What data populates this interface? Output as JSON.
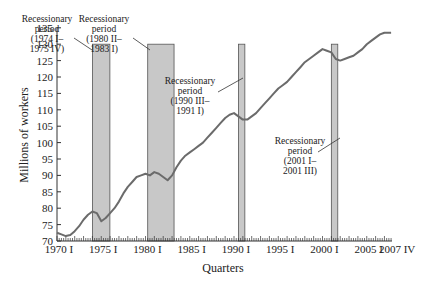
{
  "chart_data": {
    "type": "line",
    "title": "",
    "xlabel": "Quarters",
    "ylabel": "Millions of workers",
    "ylim": [
      70,
      135
    ],
    "yticks": [
      70,
      75,
      80,
      85,
      90,
      95,
      100,
      105,
      110,
      115,
      120,
      125,
      130,
      135
    ],
    "xticks": [
      {
        "label": "1970 I",
        "year": 1970.0
      },
      {
        "label": "1975 I",
        "year": 1975.0
      },
      {
        "label": "1980 I",
        "year": 1980.0
      },
      {
        "label": "1985 I",
        "year": 1985.0
      },
      {
        "label": "1990 I",
        "year": 1990.0
      },
      {
        "label": "1995 I",
        "year": 1995.0
      },
      {
        "label": "2000 I",
        "year": 2000.0
      },
      {
        "label": "2005 I",
        "year": 2005.0
      },
      {
        "label": "2007 IV",
        "year": 2007.75
      }
    ],
    "grid": false,
    "series": [
      {
        "name": "Employment",
        "x": [
          1970.0,
          1970.5,
          1971.0,
          1971.5,
          1972.0,
          1972.5,
          1973.0,
          1973.5,
          1974.0,
          1974.5,
          1975.0,
          1975.5,
          1976.0,
          1976.5,
          1977.0,
          1977.5,
          1978.0,
          1978.5,
          1979.0,
          1979.5,
          1980.0,
          1980.5,
          1981.0,
          1981.5,
          1982.0,
          1982.5,
          1983.0,
          1983.5,
          1984.0,
          1984.5,
          1985.0,
          1985.5,
          1986.0,
          1986.5,
          1987.0,
          1987.5,
          1988.0,
          1988.5,
          1989.0,
          1989.5,
          1990.0,
          1990.5,
          1991.0,
          1991.5,
          1992.0,
          1992.5,
          1993.0,
          1993.5,
          1994.0,
          1994.5,
          1995.0,
          1995.5,
          1996.0,
          1996.5,
          1997.0,
          1997.5,
          1998.0,
          1998.5,
          1999.0,
          1999.5,
          2000.0,
          2000.5,
          2001.0,
          2001.5,
          2002.0,
          2002.5,
          2003.0,
          2003.5,
          2004.0,
          2004.5,
          2005.0,
          2005.5,
          2006.0,
          2006.5,
          2007.0,
          2007.75
        ],
        "values": [
          72.5,
          72.0,
          71.5,
          71.8,
          73.0,
          74.5,
          76.5,
          78.0,
          79.0,
          78.5,
          76.0,
          77.0,
          78.5,
          80.0,
          82.0,
          84.5,
          86.5,
          88.0,
          89.5,
          90.0,
          90.5,
          90.0,
          91.0,
          90.5,
          89.5,
          88.5,
          90.0,
          92.5,
          94.5,
          96.0,
          97.0,
          98.0,
          99.0,
          100.0,
          101.5,
          103.0,
          104.5,
          106.0,
          107.5,
          108.5,
          109.0,
          108.0,
          107.0,
          107.0,
          108.0,
          109.0,
          110.5,
          112.0,
          113.5,
          115.0,
          116.5,
          117.5,
          118.5,
          120.0,
          121.5,
          123.0,
          124.5,
          125.5,
          126.5,
          127.5,
          128.5,
          128.0,
          127.5,
          125.5,
          125.0,
          125.5,
          126.0,
          126.5,
          127.5,
          128.5,
          130.0,
          131.0,
          132.0,
          133.0,
          133.5,
          133.5
        ]
      }
    ],
    "shaded_regions": [
      {
        "label": "Recessionary period (1974 I–1975 IV)",
        "start": 1974.0,
        "end": 1975.75
      },
      {
        "label": "Recessionary period (1980 II–1983 I)",
        "start": 1980.25,
        "end": 1983.0
      },
      {
        "label": "Recessionary period (1990 III–1991 I)",
        "start": 1990.5,
        "end": 1991.0
      },
      {
        "label": "Recessionary period (2001 I–2001 III)",
        "start": 2001.0,
        "end": 2001.5
      }
    ],
    "annotations": [
      {
        "lines": [
          "Recessionary",
          "period",
          "(1974 I–",
          "1975 IV)"
        ]
      },
      {
        "lines": [
          "Recessionary",
          "period",
          "(1980 II–",
          "1983 I)"
        ]
      },
      {
        "lines": [
          "Recessionary",
          "period",
          "(1990 III–",
          "1991 I)"
        ]
      },
      {
        "lines": [
          "Recessionary",
          "period",
          "(2001 I–",
          "2001 III)"
        ]
      }
    ]
  },
  "colors": {
    "line": "#6b6b6b",
    "bar_fill": "#c8c8c8",
    "bar_stroke": "#555555",
    "axis": "#333333"
  }
}
